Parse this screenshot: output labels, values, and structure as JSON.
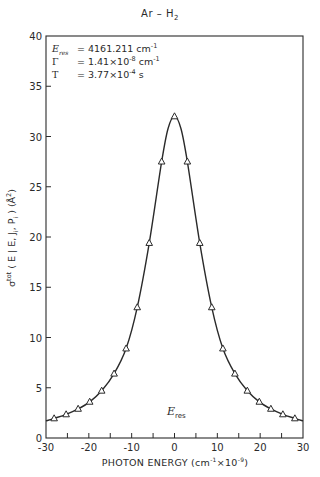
{
  "chart_data": {
    "type": "line",
    "title": "Ar – H2",
    "xlabel": "PHOTON ENERGY (cm^-1 x10^-9)",
    "ylabel": "σ^tot (E | E, J, P) (Å^2)",
    "xlim": [
      -30,
      30
    ],
    "ylim": [
      0,
      40
    ],
    "x_ticks": [
      -30,
      -20,
      -10,
      0,
      10,
      20,
      30
    ],
    "x_minor_ticks": [
      -25,
      -15,
      -5,
      5,
      15,
      25
    ],
    "y_ticks": [
      0,
      5,
      10,
      15,
      20,
      25,
      30,
      35,
      40
    ],
    "grid": false,
    "legend": null,
    "annotations": [
      {
        "label": "E_res",
        "text": "E_res = 4161.211 cm^-1"
      },
      {
        "label": "Γ",
        "text": "Γ = 1.41×10^-8 cm^-1"
      },
      {
        "label": "T",
        "text": "T = 3.77×10^-4 s"
      },
      {
        "label": "E_res marker",
        "text": "E_res",
        "position_x": 0
      }
    ],
    "series": [
      {
        "name": "computed points (triangles)",
        "marker": "triangle",
        "x": [
          -28.1,
          -25.3,
          -22.5,
          -19.8,
          -17.0,
          -14.1,
          -11.3,
          -8.7,
          -5.9,
          -3.0,
          0,
          3.0,
          5.9,
          8.7,
          11.3,
          14.1,
          17.0,
          19.8,
          22.5,
          25.3,
          28.1
        ],
        "y": [
          1.95,
          2.35,
          2.9,
          3.6,
          4.7,
          6.4,
          8.9,
          13.0,
          19.4,
          27.5,
          32.0,
          27.5,
          19.4,
          13.0,
          8.9,
          6.4,
          4.7,
          3.6,
          2.9,
          2.35,
          1.95
        ]
      },
      {
        "name": "Lorentzian fit (solid line)",
        "marker": "none",
        "x": [
          -30,
          -28.1,
          -25.3,
          -22.5,
          -19.8,
          -17.0,
          -14.1,
          -11.3,
          -8.7,
          -5.9,
          -3.0,
          -1.5,
          0,
          1.5,
          3.0,
          5.9,
          8.7,
          11.3,
          14.1,
          17.0,
          19.8,
          22.5,
          25.3,
          28.1,
          30
        ],
        "y": [
          1.7,
          1.95,
          2.35,
          2.9,
          3.6,
          4.7,
          6.4,
          8.9,
          13.0,
          19.4,
          27.5,
          30.8,
          32.0,
          30.8,
          27.5,
          19.4,
          13.0,
          8.9,
          6.4,
          4.7,
          3.6,
          2.9,
          2.35,
          1.95,
          1.7
        ]
      }
    ]
  },
  "text": {
    "title_main": "Ar  –  H",
    "title_sub": "2",
    "ann_eres_sym": "E",
    "ann_eres_sub": "res",
    "ann_eres_val": " = 4161.211 cm",
    "ann_eres_exp": "-1",
    "ann_gamma_sym": "Γ",
    "ann_gamma_val": " = 1.41×10",
    "ann_gamma_exp": "-8",
    "ann_gamma_unit": " cm",
    "ann_gamma_unit_exp": "-1",
    "ann_t_sym": "T",
    "ann_t_val": " = 3.77×10",
    "ann_t_exp": "-4",
    "ann_t_unit": "  s",
    "xlabel_main": "PHOTON ENERGY (cm",
    "xlabel_exp1": "-1",
    "xlabel_mid": "×10",
    "xlabel_exp2": "-9",
    "xlabel_end": ")",
    "ylabel_sigma": "σ",
    "ylabel_sup": "tot",
    "ylabel_body": " ( E | E, J",
    "ylabel_sub1": "i",
    "ylabel_mid": ", P",
    "ylabel_sub2": "i",
    "ylabel_unit": " ) (Å",
    "ylabel_unit_exp": "2",
    "ylabel_end": ")",
    "eres_main": "E",
    "eres_sub": "res"
  },
  "colors": {
    "ink": "#2a2a2a",
    "background": "#ffffff"
  }
}
